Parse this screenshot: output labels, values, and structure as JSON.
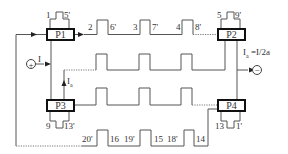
{
  "diagram": {
    "ports": {
      "p1": "P1",
      "p2": "P2",
      "p3": "P3",
      "p4": "P4"
    },
    "labels": {
      "p1_top_left": "1",
      "p1_top_right": "5'",
      "p2_top_left": "5",
      "p2_top_right": "9'",
      "p3_bottom_left": "9",
      "p3_bottom_right": "13'",
      "p4_bottom_left": "13",
      "p4_bottom_right": "1'",
      "top_row": [
        "2",
        "6'",
        "3",
        "7'",
        "4",
        "8'"
      ],
      "bottom_row": [
        "20'",
        "16",
        "19'",
        "15",
        "18'",
        "14"
      ],
      "input_current": "I",
      "sense_current_main": "I",
      "sense_current_sub": "a",
      "output_current_main": "I",
      "output_current_sub": "a",
      "output_current_eq": "=I/2a"
    },
    "terminals": {
      "input": "+",
      "output": "−"
    },
    "colors": {
      "wire": "#555555",
      "box_border": "#111111",
      "text": "#333333"
    }
  }
}
